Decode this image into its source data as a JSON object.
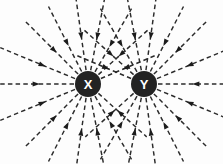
{
  "figure": {
    "background_color": "#fdfdfd",
    "width": 223,
    "height": 164
  },
  "charges": [
    {
      "id": "charge-x",
      "label": "X",
      "cx": 88,
      "cy": 84,
      "r": 13,
      "fill": "#232323",
      "label_color": "#ffffff",
      "polarity": "negative"
    },
    {
      "id": "charge-y",
      "label": "Y",
      "cx": 144,
      "cy": 84,
      "r": 13,
      "fill": "#232323",
      "label_color": "#ffffff",
      "polarity": "negative"
    }
  ],
  "field": {
    "line_color": "#2b2b2b",
    "line_width": 1.45,
    "dash_pattern": "4.5 3.2",
    "arrow_color": "#1c1c1c",
    "arrow_direction": "inward",
    "description": "Dashed field lines converge inward toward both charges; no lines cross the midpoint region between X and Y."
  },
  "chart_data": {
    "type": "line",
    "xlabel": "",
    "ylabel": "",
    "xlim": [
      0,
      223
    ],
    "ylim": [
      0,
      164
    ],
    "grid": false,
    "legend": "none",
    "annotations": [
      "X",
      "Y"
    ],
    "series": [
      {
        "name": "charge-X-field-lines",
        "source": {
          "x": 88,
          "y": 84
        },
        "arrow_direction": "toward-source",
        "line_count": 16,
        "angles_deg": [
          180,
          202.5,
          225,
          243,
          262,
          281,
          300,
          318,
          337,
          157.5,
          135,
          117,
          98,
          79,
          60,
          42
        ],
        "lengths": [
          88,
          82,
          78,
          74,
          80,
          80,
          74,
          70,
          62,
          82,
          78,
          74,
          80,
          80,
          74,
          66
        ]
      },
      {
        "name": "charge-Y-field-lines",
        "source": {
          "x": 144,
          "y": 84
        },
        "arrow_direction": "toward-source",
        "line_count": 16,
        "angles_deg": [
          0,
          337.5,
          315,
          297,
          278,
          259,
          240,
          222,
          203,
          22.5,
          45,
          63,
          82,
          101,
          120,
          138
        ],
        "lengths": [
          88,
          82,
          78,
          74,
          80,
          80,
          74,
          70,
          62,
          82,
          78,
          74,
          80,
          80,
          74,
          66
        ]
      }
    ]
  }
}
